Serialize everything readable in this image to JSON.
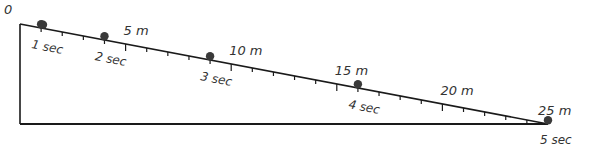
{
  "diagram": {
    "origin_label": "0",
    "colors": {
      "line": "#1a1a1a",
      "ball": "#3a3a3a",
      "text": "#333333",
      "background": "#ffffff"
    },
    "geometry": {
      "top_vertex": [
        20,
        24
      ],
      "bottom_left_vertex": [
        20,
        124
      ],
      "right_vertex": [
        548,
        124
      ],
      "total_distance_m": 25,
      "tick_every_m": 1,
      "major_tick_every_m": 5
    },
    "distance_labels": [
      {
        "d": 5,
        "text": "5 m"
      },
      {
        "d": 10,
        "text": "10 m"
      },
      {
        "d": 15,
        "text": "15 m"
      },
      {
        "d": 20,
        "text": "20 m"
      },
      {
        "d": 25,
        "text": "25 m"
      }
    ],
    "balls": [
      {
        "t": 0,
        "d": 0,
        "time_label": ""
      },
      {
        "t": 1,
        "d": 1,
        "time_label": "1 sec"
      },
      {
        "t": 2,
        "d": 4,
        "time_label": "2 sec"
      },
      {
        "t": 3,
        "d": 9,
        "time_label": "3 sec"
      },
      {
        "t": 4,
        "d": 16,
        "time_label": "4 sec"
      },
      {
        "t": 5,
        "d": 25,
        "time_label": "5 sec"
      }
    ]
  },
  "chart_data": {
    "type": "scatter",
    "xlabel": "time (sec)",
    "ylabel": "distance (m)",
    "x": [
      0,
      1,
      2,
      3,
      4,
      5
    ],
    "values": [
      0,
      1,
      4,
      9,
      16,
      25
    ],
    "x_tick_labels": [
      "1 sec",
      "2 sec",
      "3 sec",
      "4 sec",
      "5 sec"
    ],
    "y_tick_labels": [
      "0",
      "5 m",
      "10 m",
      "15 m",
      "20 m",
      "25 m"
    ],
    "ylim": [
      0,
      25
    ]
  }
}
